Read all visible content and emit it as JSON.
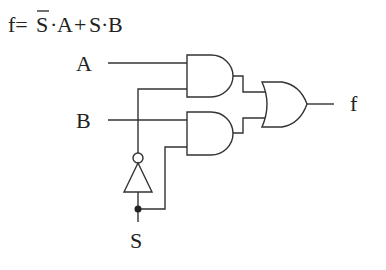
{
  "formula": {
    "prefix": "f=",
    "s_bar": "S",
    "dot1": "·",
    "a": "A",
    "plus": "+",
    "s": "S",
    "dot2": "·",
    "b": "B"
  },
  "labels": {
    "input_a": "A",
    "input_b": "B",
    "input_s": "S",
    "output_f": "f"
  },
  "gates": [
    {
      "type": "AND",
      "inputs": [
        "A",
        "NOT S"
      ],
      "name": "and-gate-1"
    },
    {
      "type": "AND",
      "inputs": [
        "B",
        "S"
      ],
      "name": "and-gate-2"
    },
    {
      "type": "OR",
      "inputs": [
        "and-gate-1",
        "and-gate-2"
      ],
      "name": "or-gate"
    },
    {
      "type": "NOT",
      "inputs": [
        "S"
      ],
      "name": "not-gate"
    }
  ],
  "colors": {
    "stroke": "#333333",
    "background": "#ffffff"
  }
}
